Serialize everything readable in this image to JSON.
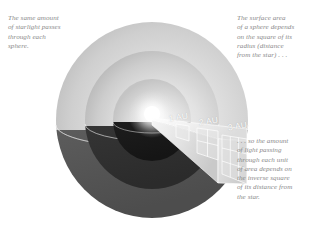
{
  "figure": {
    "notes": {
      "left": "The same amount\nof starlight passes\nthrough each\nsphere.",
      "right_top": "The surface area\nof a sphere depends\non the square of its\nradius (distance\nfrom the star) . . .",
      "right_bottom": ". . . so the amount\nof light passing\nthrough each unit\nof area depends on\nthe inverse square\nof its distance from\nthe star."
    },
    "distance_labels": [
      {
        "id": "1au",
        "text": "1 AU"
      },
      {
        "id": "2au",
        "text": "2 AU"
      },
      {
        "id": "3au",
        "text": "3 AU"
      }
    ],
    "shells": [
      {
        "label": "1 AU",
        "radius_au": 1,
        "relative_area": 1
      },
      {
        "label": "2 AU",
        "radius_au": 2,
        "relative_area": 4
      },
      {
        "label": "3 AU",
        "radius_au": 3,
        "relative_area": 9
      }
    ],
    "beam_panels": [
      {
        "label": "1 AU",
        "grid": "1x1",
        "cells": 1
      },
      {
        "label": "2 AU",
        "grid": "2x2",
        "cells": 4
      },
      {
        "label": "3 AU",
        "grid": "3x3",
        "cells": 9
      }
    ],
    "colors": {
      "background": "#ffffff",
      "note_text": "#8a8a8a",
      "label_text": "#ffffff",
      "shell_light": "#d9d9d9",
      "shell_mid": "#c9c9c9",
      "shell_rim": "#b4b4b4",
      "interior_dark": "#5a5a5a",
      "interior_darker": "#343434",
      "interior_darkest": "#1d1d1d",
      "star_glow": "#ffffff",
      "beam_fill": "#e8e8e8",
      "beam_edge": "#ffffff"
    }
  }
}
